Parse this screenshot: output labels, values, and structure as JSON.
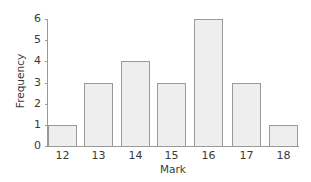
{
  "chart_data": {
    "type": "bar",
    "title": "",
    "xlabel": "Mark",
    "ylabel": "Frequency",
    "categories": [
      "12",
      "13",
      "14",
      "15",
      "16",
      "17",
      "18"
    ],
    "values": [
      1,
      3,
      4,
      3,
      6,
      3,
      1
    ],
    "ylim": [
      0,
      6
    ],
    "yticks": [
      "0",
      "1",
      "2",
      "3",
      "4",
      "5",
      "6"
    ],
    "grid": false,
    "legend": null,
    "bar_color": "#eeeeee",
    "bar_edge_color": "#9a9a9a"
  }
}
